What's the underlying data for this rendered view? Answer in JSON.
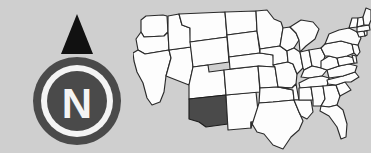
{
  "figure": {
    "background_color": "#cfcfcf",
    "width": 371,
    "height": 153,
    "caption": ""
  },
  "compass": {
    "name": "north-compass-rose",
    "letter": "N",
    "needle_direction": "north",
    "needle_color": "#111111",
    "ring_outer_color": "#4a4a4a",
    "ring_inner_color": "#f4f4f4",
    "disc_color": "#4a4a4a",
    "letter_color": "#f4f4f4"
  },
  "map": {
    "name": "united-states-map",
    "title": "",
    "region": "Contiguous United States",
    "state_fill_color": "#fdfdfd",
    "state_border_color": "#2b2b2b",
    "highlight_color": "#4a4a4a",
    "highlighted_states": [
      {
        "code": "AZ",
        "label": "Arizona",
        "fill": "#4a4a4a"
      }
    ],
    "states": [
      {
        "code": "WA",
        "label": "Washington"
      },
      {
        "code": "OR",
        "label": "Oregon"
      },
      {
        "code": "CA",
        "label": "California"
      },
      {
        "code": "NV",
        "label": "Nevada"
      },
      {
        "code": "ID",
        "label": "Idaho"
      },
      {
        "code": "MT",
        "label": "Montana"
      },
      {
        "code": "WY",
        "label": "Wyoming"
      },
      {
        "code": "UT",
        "label": "Utah"
      },
      {
        "code": "AZ",
        "label": "Arizona"
      },
      {
        "code": "NM",
        "label": "New Mexico"
      },
      {
        "code": "CO",
        "label": "Colorado"
      },
      {
        "code": "ND",
        "label": "North Dakota"
      },
      {
        "code": "SD",
        "label": "South Dakota"
      },
      {
        "code": "NE",
        "label": "Nebraska"
      },
      {
        "code": "KS",
        "label": "Kansas"
      },
      {
        "code": "OK",
        "label": "Oklahoma"
      },
      {
        "code": "TX",
        "label": "Texas"
      },
      {
        "code": "MN",
        "label": "Minnesota"
      },
      {
        "code": "IA",
        "label": "Iowa"
      },
      {
        "code": "MO",
        "label": "Missouri"
      },
      {
        "code": "AR",
        "label": "Arkansas"
      },
      {
        "code": "LA",
        "label": "Louisiana"
      },
      {
        "code": "WI",
        "label": "Wisconsin"
      },
      {
        "code": "IL",
        "label": "Illinois"
      },
      {
        "code": "MI",
        "label": "Michigan"
      },
      {
        "code": "IN",
        "label": "Indiana"
      },
      {
        "code": "OH",
        "label": "Ohio"
      },
      {
        "code": "KY",
        "label": "Kentucky"
      },
      {
        "code": "TN",
        "label": "Tennessee"
      },
      {
        "code": "MS",
        "label": "Mississippi"
      },
      {
        "code": "AL",
        "label": "Alabama"
      },
      {
        "code": "GA",
        "label": "Georgia"
      },
      {
        "code": "FL",
        "label": "Florida"
      },
      {
        "code": "SC",
        "label": "South Carolina"
      },
      {
        "code": "NC",
        "label": "North Carolina"
      },
      {
        "code": "VA",
        "label": "Virginia"
      },
      {
        "code": "WV",
        "label": "West Virginia"
      },
      {
        "code": "MD",
        "label": "Maryland"
      },
      {
        "code": "DE",
        "label": "Delaware"
      },
      {
        "code": "PA",
        "label": "Pennsylvania"
      },
      {
        "code": "NJ",
        "label": "New Jersey"
      },
      {
        "code": "NY",
        "label": "New York"
      },
      {
        "code": "CT",
        "label": "Connecticut"
      },
      {
        "code": "RI",
        "label": "Rhode Island"
      },
      {
        "code": "MA",
        "label": "Massachusetts"
      },
      {
        "code": "VT",
        "label": "Vermont"
      },
      {
        "code": "NH",
        "label": "New Hampshire"
      },
      {
        "code": "ME",
        "label": "Maine"
      }
    ]
  }
}
